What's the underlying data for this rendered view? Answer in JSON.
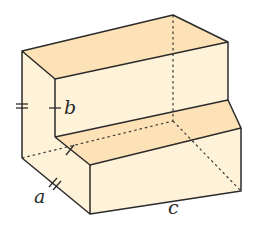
{
  "diagram": {
    "type": "3d-step-solid",
    "colors": {
      "top_face": "#FCE2B6",
      "front_face": "#FEF3D9",
      "edge": "#2b2b2b",
      "hidden_edge": "#3a3a3a"
    },
    "labels": {
      "a": "a",
      "b": "b",
      "c": "c"
    },
    "tick_marks": {
      "left_edge": "double tick (=)",
      "step_height": "single tick",
      "depth_edge": "double tick (//)",
      "step_floor": "single tick"
    }
  }
}
